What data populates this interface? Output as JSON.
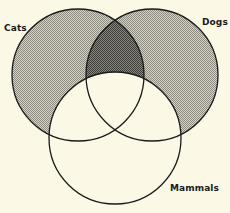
{
  "diagram": {
    "type": "venn",
    "sets": [
      {
        "id": "cats",
        "label": "Cats",
        "shaded": true
      },
      {
        "id": "dogs",
        "label": "Dogs",
        "shaded": true
      },
      {
        "id": "mammals",
        "label": "Mammals",
        "shaded": false
      }
    ],
    "shading": {
      "light_regions": [
        "cats-only",
        "dogs-only"
      ],
      "dark_regions": [
        "cats-and-dogs-not-mammals"
      ],
      "unshaded_regions": [
        "mammals",
        "outside"
      ]
    },
    "colors": {
      "background": "#fbf8e6",
      "light_shade": "#b9b7a8",
      "dark_shade": "#6e6c62",
      "stroke": "#1a1a1a"
    }
  }
}
